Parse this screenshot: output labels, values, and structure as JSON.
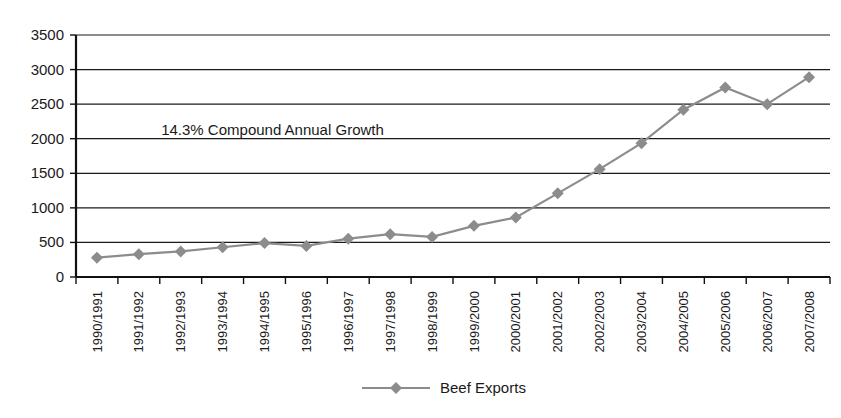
{
  "chart_data": {
    "type": "line",
    "title": "",
    "xlabel": "",
    "ylabel": "",
    "ylim": [
      0,
      3500
    ],
    "ytick_step": 500,
    "grid": true,
    "legend_position": "bottom",
    "annotations": [
      {
        "name": "growth-annotation",
        "text": "14.3% Compound Annual Growth",
        "x_category": "1994/1995",
        "y_value": 2050
      }
    ],
    "yticks": [
      0,
      500,
      1000,
      1500,
      2000,
      2500,
      3000,
      3500
    ],
    "ytick_labels": [
      "0",
      "500",
      "1000",
      "1500",
      "2000",
      "2500",
      "3000",
      "3500"
    ],
    "categories": [
      "1990/1991",
      "1991/1992",
      "1992/1993",
      "1993/1994",
      "1994/1995",
      "1995/1996",
      "1996/1997",
      "1997/1998",
      "1998/1999",
      "1999/2000",
      "2000/2001",
      "2001/2002",
      "2002/2003",
      "2003/2004",
      "2004/2005",
      "2005/2006",
      "2006/2007",
      "2007/2008"
    ],
    "series": [
      {
        "name": "Beef Exports",
        "color": "#8c8c8c",
        "marker": "diamond",
        "values": [
          280,
          330,
          370,
          430,
          490,
          450,
          555,
          620,
          580,
          740,
          860,
          1210,
          1560,
          1935,
          2420,
          2740,
          2500,
          2890
        ]
      }
    ]
  },
  "legend": {
    "entries": [
      {
        "label": "Beef Exports",
        "color": "#8c8c8c"
      }
    ]
  },
  "colors": {
    "series": "#8c8c8c",
    "axis": "#111111",
    "grid": "#1a1a1a",
    "background": "#ffffff",
    "text": "#1a1a1a"
  }
}
